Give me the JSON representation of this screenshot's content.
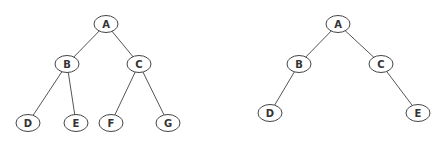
{
  "diagrams": [
    {
      "name": "complete-binary-tree",
      "nodes": [
        {
          "id": "A",
          "label": "A"
        },
        {
          "id": "B",
          "label": "B"
        },
        {
          "id": "C",
          "label": "C"
        },
        {
          "id": "D",
          "label": "D"
        },
        {
          "id": "E",
          "label": "E"
        },
        {
          "id": "F",
          "label": "F"
        },
        {
          "id": "G",
          "label": "G"
        }
      ],
      "edges": [
        [
          "A",
          "B"
        ],
        [
          "A",
          "C"
        ],
        [
          "B",
          "D"
        ],
        [
          "B",
          "E"
        ],
        [
          "C",
          "F"
        ],
        [
          "C",
          "G"
        ]
      ]
    },
    {
      "name": "incomplete-binary-tree",
      "nodes": [
        {
          "id": "A",
          "label": "A"
        },
        {
          "id": "B",
          "label": "B"
        },
        {
          "id": "C",
          "label": "C"
        },
        {
          "id": "D",
          "label": "D"
        },
        {
          "id": "E",
          "label": "E"
        }
      ],
      "edges": [
        [
          "A",
          "B"
        ],
        [
          "A",
          "C"
        ],
        [
          "B",
          "D"
        ],
        [
          "C",
          "E"
        ]
      ]
    }
  ]
}
